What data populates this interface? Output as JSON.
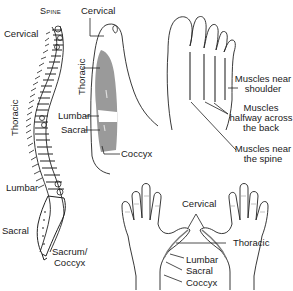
{
  "spine_panel": {
    "title": "Spine",
    "labels": {
      "cervical": "Cervical",
      "thoracic": "Thoracic",
      "lumbar": "Lumbar",
      "sacral": "Sacral",
      "sacrum_coccyx_1": "Sacrum/",
      "sacrum_coccyx_2": "Coccyx"
    }
  },
  "foot_side_panel": {
    "labels": {
      "cervical": "Cervical",
      "thoracic": "Thoracic",
      "lumbar": "Lumbar",
      "sacral": "Sacral",
      "coccyx": "Coccyx"
    },
    "zone_color": "#9a9a9a"
  },
  "foot_top_panel": {
    "labels": {
      "shoulder_1": "Muscles near",
      "shoulder_2": "shoulder",
      "halfway_1": "Muscles",
      "halfway_2": "halfway across",
      "halfway_3": "the back",
      "spine_1": "Muscles near",
      "spine_2": "the spine"
    }
  },
  "hands_panel": {
    "labels": {
      "cervical": "Cervical",
      "thoracic": "Thoracic",
      "lumbar": "Lumbar",
      "sacral": "Sacral",
      "coccyx": "Coccyx"
    }
  }
}
